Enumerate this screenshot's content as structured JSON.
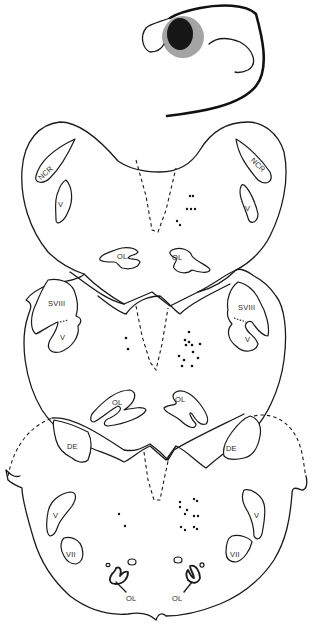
{
  "figure": {
    "background": "#ffffff",
    "ink_color": "#1a1a1a",
    "sections": [
      {
        "id": "inset",
        "description": "small whole-brain inset with dark lesion",
        "labels": []
      },
      {
        "id": "section-1",
        "labels": {
          "left_ncr": "NCR",
          "right_ncr": "NCR",
          "left_v": "V",
          "right_v": "V",
          "left_ol": "OL",
          "right_ol": "OL"
        },
        "dot_count": 7
      },
      {
        "id": "section-2",
        "labels": {
          "left_sviii": "SVIII",
          "right_sviii": "SVIII",
          "left_v": "V",
          "right_v": "V",
          "left_ol": "OL",
          "right_ol": "OL"
        },
        "dot_count": 13
      },
      {
        "id": "section-3",
        "labels": {
          "left_de": "DE",
          "right_de": "DE",
          "left_v": "V",
          "right_v": "V",
          "left_vii": "VII",
          "right_vii": "VII",
          "left_ol": "OL",
          "right_ol": "OL"
        },
        "dot_count": 12
      }
    ]
  }
}
